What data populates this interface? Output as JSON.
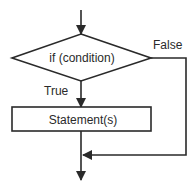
{
  "diagram": {
    "type": "flowchart",
    "colors": {
      "stroke": "#2a2a2a",
      "background": "#ffffff",
      "text": "#2a2a2a"
    },
    "nodes": [
      {
        "id": "decision",
        "shape": "diamond",
        "label": "if (condition)"
      },
      {
        "id": "statements",
        "shape": "rectangle",
        "label": "Statement(s)"
      }
    ],
    "edges": [
      {
        "from": "entry",
        "to": "decision",
        "label": ""
      },
      {
        "from": "decision",
        "to": "statements",
        "label": "True"
      },
      {
        "from": "decision",
        "to": "merge",
        "label": "False"
      },
      {
        "from": "statements",
        "to": "merge",
        "label": ""
      },
      {
        "from": "merge",
        "to": "exit",
        "label": ""
      }
    ],
    "labels": {
      "condition": "if (condition)",
      "statement": "Statement(s)",
      "true_branch": "True",
      "false_branch": "False"
    }
  }
}
